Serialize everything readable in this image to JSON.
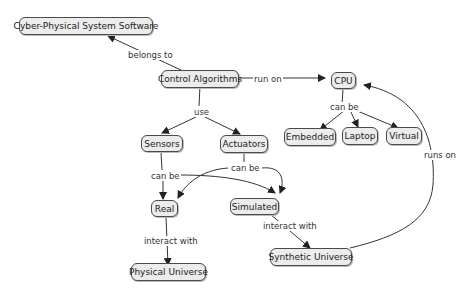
{
  "nodes": {
    "cps": "Cyber-Physical System Software",
    "control": "Control Algorithms",
    "cpu": "CPU",
    "embedded": "Embedded",
    "laptop": "Laptop",
    "virtual": "Virtual",
    "sensors": "Sensors",
    "actuators": "Actuators",
    "real": "Real",
    "simulated": "Simulated",
    "physical": "Physical Universe",
    "synthetic": "Synthetic Universe"
  },
  "links": {
    "belongs_to": "belongs to",
    "run_on": "run on",
    "cpu_can_be": "can be",
    "use": "use",
    "sensors_can_be": "can be",
    "actuators_can_be": "can be",
    "real_interact": "interact with",
    "sim_interact": "interact with",
    "runs_on": "runs on"
  }
}
